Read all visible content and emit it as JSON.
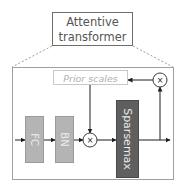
{
  "diagram": {
    "title": {
      "line1": "Attentive",
      "line2": "transformer"
    },
    "blocks": {
      "fc": "FC",
      "bn": "BN",
      "sparsemax": "Sparsemax",
      "prior_scales": "Prior scales"
    },
    "operators": {
      "multiply_main": "×",
      "multiply_feedback": "×"
    },
    "colors": {
      "title_border": "#6e6e6e",
      "title_text": "#555555",
      "dashed": "#9a9a9a",
      "outer_border": "#a0a0a0",
      "fc_fill": "#b4b4b4",
      "bn_fill": "#b4b4b4",
      "sparsemax_fill": "#5f5f5f",
      "block_text": "#ececec",
      "prior_border": "#c8c8c8",
      "prior_text": "#b0b0b0",
      "arrow": "#1e1e1e"
    }
  }
}
